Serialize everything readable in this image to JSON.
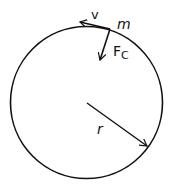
{
  "diagram": {
    "labels": {
      "velocity": "v",
      "mass": "m",
      "force_main": "F",
      "force_sub": "C",
      "radius": "r"
    },
    "colors": {
      "stroke": "#111111",
      "background": "#ffffff"
    }
  }
}
